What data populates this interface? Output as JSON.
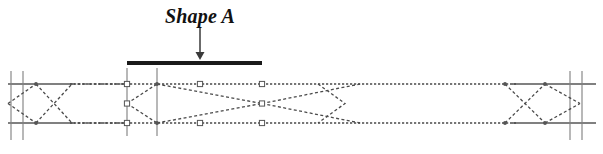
{
  "figure": {
    "title": "Shape A",
    "kind": "cad-elevation-diagram",
    "canvas": {
      "width": 603,
      "height": 154,
      "background": "#ffffff"
    }
  },
  "annotation": {
    "label_text": "Shape A",
    "label_x": 200,
    "label_y": 22,
    "arrow": {
      "name": "down-arrow",
      "x": 200,
      "y_start": 27,
      "y_end": 60,
      "color": "#3a3a3a"
    },
    "highlight_bar": {
      "name": "selected-member-bar",
      "x_start": 127,
      "x_end": 262,
      "y": 63,
      "thickness": 4,
      "color": "#1a1a1a"
    }
  },
  "colors": {
    "rail_solid": "#808080",
    "dashed_line": "#4a4a4a",
    "grid_line": "#9a9a9a",
    "marker_stroke": "#555555",
    "marker_fill": "#ffffff",
    "bar": "#1a1a1a",
    "arrow": "#3a3a3a",
    "text": "#111111"
  },
  "geometry": {
    "rail_top_y": 84,
    "rail_bottom_y": 123,
    "rail_mid_y": 103.5,
    "rail_x_start": 8,
    "rail_x_end": 596,
    "solid_rail_left": {
      "x_start": 8,
      "x_end": 72
    },
    "solid_rail_right": {
      "x_start": 512,
      "x_end": 596
    },
    "dashed_rail": {
      "x_start": 70,
      "x_end": 516
    }
  },
  "grid_lines": [
    {
      "name": "grid-line-left-outer",
      "x": 11,
      "y_top": 71,
      "y_bottom": 140
    },
    {
      "name": "grid-line-left-inner",
      "x": 23,
      "y_top": 71,
      "y_bottom": 140
    },
    {
      "name": "grid-line-mid-left",
      "x": 127,
      "y_top": 68,
      "y_bottom": 136
    },
    {
      "name": "grid-line-mid-right",
      "x": 157,
      "y_top": 68,
      "y_bottom": 136
    },
    {
      "name": "grid-line-right-inner",
      "x": 570,
      "y_top": 71,
      "y_bottom": 140
    },
    {
      "name": "grid-line-right-outer",
      "x": 582,
      "y_top": 71,
      "y_bottom": 140
    }
  ],
  "truss_nodes_top": [
    8,
    36,
    70,
    127,
    157,
    200,
    262,
    360,
    505,
    545,
    580,
    596
  ],
  "truss_nodes_bottom": [
    8,
    36,
    70,
    127,
    157,
    200,
    262,
    360,
    505,
    545,
    580,
    596
  ],
  "bracing_segments": [
    {
      "name": "brace-left-1",
      "x1": 8,
      "y1": 103.5,
      "x2": 36,
      "y2": 84
    },
    {
      "name": "brace-left-2",
      "x1": 8,
      "y1": 103.5,
      "x2": 36,
      "y2": 123
    },
    {
      "name": "brace-left-3",
      "x1": 36,
      "y1": 84,
      "x2": 72,
      "y2": 123
    },
    {
      "name": "brace-left-4",
      "x1": 36,
      "y1": 123,
      "x2": 72,
      "y2": 84
    },
    {
      "name": "brace-left-5",
      "x1": 72,
      "y1": 84,
      "x2": 127,
      "y2": 84
    },
    {
      "name": "brace-left-6",
      "x1": 72,
      "y1": 123,
      "x2": 127,
      "y2": 123
    },
    {
      "name": "brace-mid-1",
      "x1": 127,
      "y1": 103.5,
      "x2": 157,
      "y2": 84
    },
    {
      "name": "brace-mid-2",
      "x1": 127,
      "y1": 103.5,
      "x2": 157,
      "y2": 123
    },
    {
      "name": "brace-mid-3",
      "x1": 157,
      "y1": 84,
      "x2": 262,
      "y2": 103.5
    },
    {
      "name": "brace-mid-4",
      "x1": 157,
      "y1": 123,
      "x2": 262,
      "y2": 103.5
    },
    {
      "name": "brace-mid-5",
      "x1": 262,
      "y1": 103.5,
      "x2": 360,
      "y2": 84
    },
    {
      "name": "brace-mid-6",
      "x1": 262,
      "y1": 103.5,
      "x2": 360,
      "y2": 123
    },
    {
      "name": "brace-right-1",
      "x1": 505,
      "y1": 84,
      "x2": 545,
      "y2": 123
    },
    {
      "name": "brace-right-2",
      "x1": 505,
      "y1": 123,
      "x2": 545,
      "y2": 84
    },
    {
      "name": "brace-right-3",
      "x1": 545,
      "y1": 84,
      "x2": 580,
      "y2": 103.5
    },
    {
      "name": "brace-right-4",
      "x1": 545,
      "y1": 123,
      "x2": 580,
      "y2": 103.5
    }
  ],
  "chevron_marks": [
    {
      "name": "chevron-mid",
      "x1": 318,
      "y1": 84,
      "x2": 345,
      "y2": 103.5,
      "x3": 318,
      "y3": 123
    }
  ],
  "grip_markers": [
    {
      "name": "grip-handle",
      "x": 127,
      "y": 84
    },
    {
      "name": "grip-handle",
      "x": 127,
      "y": 103.5
    },
    {
      "name": "grip-handle",
      "x": 127,
      "y": 123
    },
    {
      "name": "grip-handle",
      "x": 200,
      "y": 84
    },
    {
      "name": "grip-handle",
      "x": 200,
      "y": 123
    },
    {
      "name": "grip-handle",
      "x": 262,
      "y": 84
    },
    {
      "name": "grip-handle",
      "x": 262,
      "y": 103.5
    },
    {
      "name": "grip-handle",
      "x": 262,
      "y": 123
    }
  ],
  "node_dots": [
    {
      "name": "node-dot",
      "x": 157,
      "y": 84
    },
    {
      "name": "node-dot",
      "x": 157,
      "y": 123
    },
    {
      "name": "node-dot",
      "x": 36,
      "y": 84
    },
    {
      "name": "node-dot",
      "x": 36,
      "y": 123
    },
    {
      "name": "node-dot",
      "x": 505,
      "y": 84
    },
    {
      "name": "node-dot",
      "x": 505,
      "y": 123
    },
    {
      "name": "node-dot",
      "x": 545,
      "y": 84
    },
    {
      "name": "node-dot",
      "x": 545,
      "y": 123
    }
  ]
}
